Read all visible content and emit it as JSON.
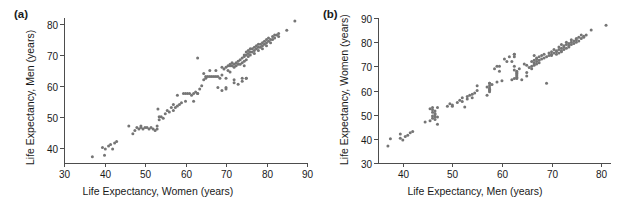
{
  "figure": {
    "background_color": "#ffffff",
    "marker_color": "#757575",
    "axis_color": "#4d4d4d",
    "text_color": "#1a1a1a"
  },
  "panels": [
    {
      "key": "a",
      "label": "(a)",
      "label_name": "panel-label-a"
    },
    {
      "key": "b",
      "label": "(b)",
      "label_name": "panel-label-b"
    }
  ],
  "chart_data": [
    {
      "type": "scatter",
      "panel": "(a)",
      "title": "",
      "xlabel": "Life Expectancy, Women (years)",
      "ylabel": "Life Expectancy, Men (years)",
      "xlim": [
        30,
        90
      ],
      "ylim": [
        35,
        82
      ],
      "xticks": [
        30,
        40,
        50,
        60,
        70,
        80,
        90
      ],
      "yticks": [
        40,
        50,
        60,
        70,
        80
      ],
      "xticklabels": [
        "30",
        "40",
        "50",
        "60",
        "70",
        "80",
        "90"
      ],
      "yticklabels": [
        "40",
        "50",
        "60",
        "70",
        "80"
      ],
      "grid": false,
      "legend": false,
      "marker": "circle",
      "marker_size": 3,
      "x": [
        37.0,
        39.5,
        40.0,
        40.2,
        41.0,
        41.5,
        42.0,
        42.5,
        43.0,
        46.0,
        47.0,
        47.5,
        48.0,
        48.5,
        49.0,
        49.0,
        49.5,
        50.0,
        50.5,
        51.0,
        51.5,
        52.0,
        52.5,
        53.0,
        53.0,
        53.2,
        53.5,
        53.5,
        54.0,
        54.5,
        55.0,
        55.5,
        56.0,
        56.5,
        57.0,
        57.0,
        57.5,
        58.0,
        58.0,
        58.5,
        59.0,
        59.5,
        60.0,
        60.0,
        60.5,
        61.0,
        61.5,
        62.0,
        62.0,
        62.5,
        63.0,
        63.0,
        63.5,
        64.0,
        64.5,
        65.0,
        65.0,
        65.5,
        66.0,
        66.5,
        67.0,
        67.5,
        68.0,
        68.0,
        68.5,
        69.0,
        69.0,
        69.5,
        70.0,
        70.0,
        70.0,
        70.5,
        70.5,
        71.0,
        71.0,
        71.5,
        71.5,
        72.0,
        72.0,
        72.0,
        72.5,
        72.5,
        73.0,
        73.0,
        73.0,
        73.5,
        73.5,
        74.0,
        74.0,
        74.0,
        74.5,
        74.5,
        74.5,
        75.0,
        75.0,
        75.0,
        75.0,
        75.5,
        75.5,
        75.5,
        76.0,
        76.0,
        76.0,
        76.5,
        76.5,
        77.0,
        77.0,
        77.0,
        77.5,
        77.5,
        78.0,
        78.0,
        78.0,
        78.5,
        78.5,
        79.0,
        79.0,
        79.0,
        79.5,
        79.5,
        80.0,
        80.0,
        80.0,
        80.5,
        80.5,
        81.0,
        81.0,
        81.5,
        81.5,
        82.0,
        82.0,
        82.5,
        83.0,
        83.0,
        85.0,
        87.0,
        63.0,
        69.0,
        71.0,
        72.0,
        74.0,
        74.5,
        75.0,
        70.0,
        67.5,
        66.0,
        64.5
      ],
      "y": [
        37.0,
        40.0,
        37.5,
        39.5,
        40.5,
        41.0,
        39.5,
        41.5,
        42.0,
        47.0,
        44.5,
        45.5,
        46.5,
        46.0,
        46.5,
        47.0,
        46.0,
        46.5,
        46.5,
        46.0,
        46.5,
        46.0,
        45.5,
        46.0,
        47.0,
        52.5,
        49.0,
        50.0,
        50.0,
        49.5,
        51.0,
        52.0,
        51.5,
        53.0,
        52.0,
        54.0,
        53.0,
        53.5,
        57.0,
        54.0,
        54.5,
        57.5,
        55.0,
        57.5,
        57.5,
        57.5,
        57.0,
        55.0,
        57.5,
        58.0,
        57.5,
        69.0,
        59.0,
        60.0,
        62.0,
        62.5,
        63.0,
        63.0,
        63.0,
        63.0,
        63.0,
        63.0,
        59.5,
        63.0,
        62.5,
        58.5,
        66.0,
        65.5,
        59.5,
        62.5,
        66.0,
        65.0,
        66.5,
        64.5,
        67.0,
        66.5,
        67.5,
        61.0,
        66.0,
        67.0,
        66.5,
        67.5,
        60.5,
        67.0,
        68.0,
        67.0,
        68.5,
        62.5,
        67.5,
        69.0,
        68.0,
        69.5,
        70.0,
        62.5,
        68.5,
        70.0,
        71.0,
        69.5,
        70.5,
        71.5,
        70.0,
        71.0,
        72.0,
        71.0,
        72.0,
        70.5,
        71.5,
        72.5,
        72.0,
        73.0,
        71.5,
        72.5,
        73.5,
        72.5,
        73.5,
        72.0,
        73.0,
        74.0,
        73.5,
        74.5,
        73.0,
        74.0,
        75.0,
        74.5,
        75.5,
        74.0,
        75.0,
        75.0,
        76.0,
        75.5,
        76.5,
        76.5,
        76.0,
        77.0,
        78.0,
        81.0,
        57.5,
        63.5,
        66.5,
        62.0,
        61.5,
        66.5,
        62.5,
        59.0,
        65.0,
        65.0,
        64.0
      ]
    },
    {
      "type": "scatter",
      "panel": "(b)",
      "title": "",
      "xlabel": "Life Expectancy, Men (years)",
      "ylabel": "Life Expectancy, Women (years)",
      "xlim": [
        35,
        82
      ],
      "ylim": [
        30,
        90
      ],
      "xticks": [
        40,
        50,
        60,
        70,
        80
      ],
      "yticks": [
        30,
        40,
        50,
        60,
        70,
        80,
        90
      ],
      "xticklabels": [
        "40",
        "50",
        "60",
        "70",
        "80"
      ],
      "yticklabels": [
        "30",
        "40",
        "50",
        "60",
        "70",
        "80",
        "90"
      ],
      "grid": false,
      "legend": false,
      "marker": "circle",
      "marker_size": 3,
      "note": "same data as panel (a) with axes swapped",
      "swap_of": "(a)"
    }
  ]
}
